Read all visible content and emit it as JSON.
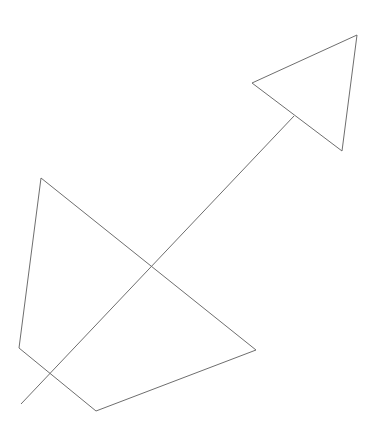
{
  "canvas": {
    "width": 373,
    "height": 435,
    "background": "#ffffff"
  },
  "stroke": {
    "color": "#6e6e6e",
    "width": 1
  },
  "shapes": {
    "triangle": {
      "points": "252,83 357,35 342,151"
    },
    "quadrilateral": {
      "points": "41,178 256,350 96,411 19,348"
    },
    "line": {
      "x1": 21,
      "y1": 404,
      "x2": 294,
      "y2": 116
    }
  }
}
